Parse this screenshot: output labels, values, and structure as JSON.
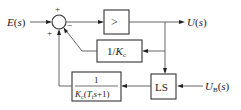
{
  "diagram": {
    "type": "block-diagram",
    "signals": {
      "input": "E(s)",
      "input_var": "E",
      "output": "U(s)",
      "output_var": "U",
      "setpoint_var": "U",
      "setpoint_sub": "B",
      "setpoint_arg": "(s)"
    },
    "summing_junction": {
      "signs": {
        "top": "+",
        "bottom_left": "+",
        "right": "−"
      }
    },
    "blocks": {
      "comparator": {
        "label": ">"
      },
      "gain": {
        "label_prefix": "1/",
        "label_var": "K",
        "label_sub": "c"
      },
      "lag": {
        "numerator": "1",
        "denominator_var_K": "K",
        "denominator_sub_c": "c",
        "denominator_open": "(",
        "denominator_var_T": "T",
        "denominator_sub_i": "i",
        "denominator_rest": "s+1)"
      },
      "limit_switch": {
        "label": "LS"
      }
    },
    "colors": {
      "line": "#555555",
      "block_border": "#333333",
      "text": "#222222",
      "background": "#ffffff"
    }
  }
}
